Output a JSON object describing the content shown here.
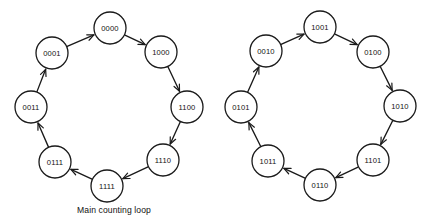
{
  "figure": {
    "background_color": "#ffffff",
    "stroke_color": "#1a1a1a",
    "node_fill_color": "#ffffff",
    "node_radius": 16,
    "width": 431,
    "height": 222
  },
  "diagrams": [
    {
      "id": "main-counting-loop",
      "caption": "Main counting loop",
      "caption_x": 114,
      "caption_y": 213,
      "center_x": 109,
      "center_y": 106,
      "ring_radius": 79,
      "direction": "clockwise",
      "nodes": [
        {
          "label": "0000",
          "x": 110,
          "y": 28
        },
        {
          "label": "1000",
          "x": 161,
          "y": 52
        },
        {
          "label": "1100",
          "x": 187,
          "y": 107
        },
        {
          "label": "1110",
          "x": 163,
          "y": 160
        },
        {
          "label": "1111",
          "x": 107,
          "y": 186
        },
        {
          "label": "0111",
          "x": 55,
          "y": 162
        },
        {
          "label": "0011",
          "x": 31,
          "y": 107
        },
        {
          "label": "0001",
          "x": 52,
          "y": 53
        }
      ],
      "edges": [
        {
          "from": "0000",
          "to": "1000"
        },
        {
          "from": "1000",
          "to": "1100"
        },
        {
          "from": "1100",
          "to": "1110"
        },
        {
          "from": "1110",
          "to": "1111"
        },
        {
          "from": "1111",
          "to": "0111"
        },
        {
          "from": "0111",
          "to": "0011"
        },
        {
          "from": "0011",
          "to": "0001"
        },
        {
          "from": "0001",
          "to": "0000"
        }
      ]
    },
    {
      "id": "secondary-loop",
      "caption": "",
      "center_x": 320,
      "center_y": 106,
      "ring_radius": 79,
      "direction": "clockwise",
      "nodes": [
        {
          "label": "1001",
          "x": 320,
          "y": 27
        },
        {
          "label": "0100",
          "x": 373,
          "y": 52
        },
        {
          "label": "1010",
          "x": 400,
          "y": 106
        },
        {
          "label": "1101",
          "x": 373,
          "y": 160
        },
        {
          "label": "0110",
          "x": 320,
          "y": 185
        },
        {
          "label": "1011",
          "x": 268,
          "y": 161
        },
        {
          "label": "0101",
          "x": 241,
          "y": 107
        },
        {
          "label": "0010",
          "x": 266,
          "y": 51
        }
      ],
      "edges": [
        {
          "from": "1001",
          "to": "0100"
        },
        {
          "from": "0100",
          "to": "1010"
        },
        {
          "from": "1010",
          "to": "1101"
        },
        {
          "from": "1101",
          "to": "0110"
        },
        {
          "from": "0110",
          "to": "1011"
        },
        {
          "from": "1011",
          "to": "0101"
        },
        {
          "from": "0101",
          "to": "0010"
        },
        {
          "from": "0010",
          "to": "1001"
        }
      ]
    }
  ]
}
